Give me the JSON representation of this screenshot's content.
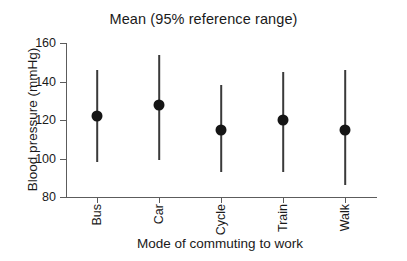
{
  "chart_data": {
    "type": "scatter",
    "title": "Mean (95% reference range)",
    "xlabel": "Mode of commuting to work",
    "ylabel": "Blood pressure (mmHg)",
    "categories": [
      "Bus",
      "Car",
      "Cycle",
      "Train",
      "Walk"
    ],
    "values": [
      122,
      128,
      115,
      120,
      115
    ],
    "lower": [
      98,
      99,
      93,
      93,
      86
    ],
    "upper": [
      146,
      154,
      138,
      145,
      146
    ],
    "ylim": [
      80,
      160
    ],
    "yticks": [
      80,
      100,
      120,
      140,
      160
    ],
    "ytick_labels": [
      "80",
      "100",
      "120",
      "140",
      "160"
    ],
    "grid": false,
    "legend": "none",
    "marker": "filled-circle",
    "error_bar_style": "vertical-line",
    "colors": {
      "marker": "#151515",
      "error_bar": "#3a3a3a",
      "axis": "#5c5c5c",
      "text": "#1a1a1a",
      "background": "#ffffff"
    }
  }
}
